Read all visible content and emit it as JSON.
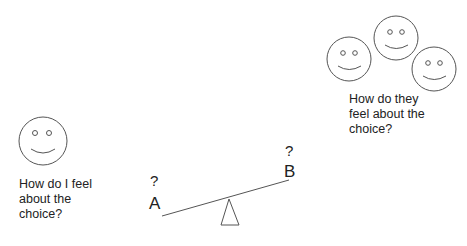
{
  "self": {
    "question_lines": [
      "How do I feel",
      "about the",
      "choice?"
    ]
  },
  "others": {
    "question_lines": [
      "How do they",
      "feel about the",
      "choice?"
    ]
  },
  "seesaw": {
    "left_label": "A",
    "left_mark": "?",
    "right_label": "B",
    "right_mark": "?"
  },
  "colors": {
    "stroke": "#555555",
    "text": "#222222"
  }
}
